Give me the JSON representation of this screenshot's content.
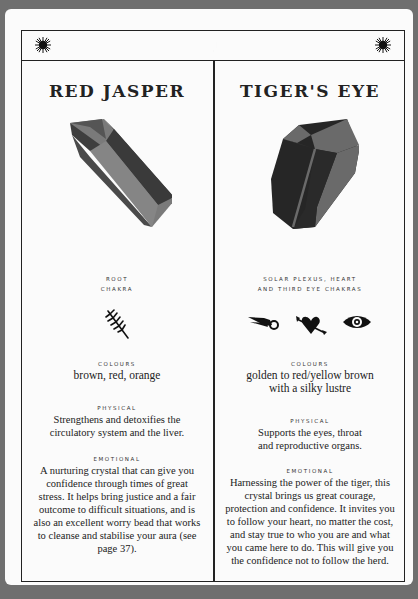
{
  "header": {
    "left_icon": "sun-icon",
    "center_icon": "crescent-moon-icon",
    "right_icon": "sun-icon"
  },
  "crystals": [
    {
      "name": "RED JASPER",
      "image": "red-jasper-crystal",
      "chakra_line1": "ROOT",
      "chakra_line2": "CHAKRA",
      "chakra_icons": [
        "root-branch-icon"
      ],
      "colours_label": "COLOURS",
      "colours_text": "brown, red, orange",
      "physical_label": "PHYSICAL",
      "physical_text": "Strengthens and detoxifies the circulatory system and the liver.",
      "emotional_label": "EMOTIONAL",
      "emotional_text": "A nurturing crystal that can give you confidence through times of great stress. It helps bring justice and a fair outcome to difficult situations, and is also an excellent worry bead that works to cleanse and stabilise your aura (see page 37)."
    },
    {
      "name": "TIGER'S EYE",
      "image": "tigers-eye-crystal",
      "chakra_line1": "SOLAR PLEXUS, HEART",
      "chakra_line2": "AND THIRD EYE CHAKRAS",
      "chakra_icons": [
        "comet-icon",
        "heart-arrow-icon",
        "eye-icon"
      ],
      "colours_label": "COLOURS",
      "colours_text": "golden to red/yellow brown with a silky lustre",
      "physical_label": "PHYSICAL",
      "physical_text": "Supports the eyes, throat and reproductive organs.",
      "emotional_label": "EMOTIONAL",
      "emotional_text": "Harnessing the power of the tiger, this crystal brings us great courage, protection and confidence. It invites you to follow your heart, no matter the cost, and stay true to who you are and what you came here to do. This will give you the confidence not to follow the herd."
    }
  ],
  "colors": {
    "background": "#6f6f6f",
    "page": "#fbfbfb",
    "ink": "#222222",
    "red_jasper_light": "#7a7a7a",
    "red_jasper_dark": "#3e3e3e",
    "tigers_eye_dark": "#262626",
    "tigers_eye_light": "#6a6a6a"
  }
}
